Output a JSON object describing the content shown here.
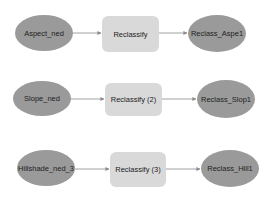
{
  "colors": {
    "data_node": "#9a9a9a",
    "tool_node": "#d9d9d9",
    "connector": "#8c8c8c",
    "text": "#222222"
  },
  "rows": [
    {
      "input": {
        "label": "Aspect_ned",
        "x": 15,
        "y": 15,
        "w": 58,
        "h": 36
      },
      "tool": {
        "label": "Reclassify",
        "x": 102,
        "y": 16,
        "w": 57,
        "h": 36
      },
      "output": {
        "label": "Reclass_Aspe1",
        "x": 188,
        "y": 15,
        "w": 58,
        "h": 37
      }
    },
    {
      "input": {
        "label": "Slope_ned",
        "x": 13,
        "y": 81,
        "w": 58,
        "h": 35
      },
      "tool": {
        "label": "Reclassify (2)",
        "x": 105,
        "y": 83,
        "w": 57,
        "h": 33
      },
      "output": {
        "label": "Reclass_Slop1",
        "x": 197,
        "y": 80,
        "w": 58,
        "h": 38
      }
    },
    {
      "input": {
        "label": "Hillshade_ned_3",
        "x": 17,
        "y": 150,
        "w": 58,
        "h": 36
      },
      "tool": {
        "label": "Reclassify (3)",
        "x": 110,
        "y": 152,
        "w": 56,
        "h": 35
      },
      "output": {
        "label": "Reclass_Hill1",
        "x": 201,
        "y": 150,
        "w": 58,
        "h": 37
      }
    }
  ]
}
